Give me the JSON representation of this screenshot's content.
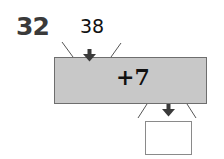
{
  "problem": {
    "number": "32",
    "input": "38",
    "operation": "+7",
    "output": ""
  },
  "colors": {
    "machine_fill": "#c8c8c8",
    "machine_border": "#6e6e6e",
    "arrow": "#3a3a3a",
    "number_text": "#3a3a3a"
  },
  "icons": {
    "input_arrow": "arrow-down",
    "output_arrow": "arrow-down"
  }
}
